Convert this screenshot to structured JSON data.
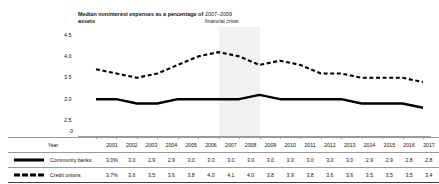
{
  "chart_data": {
    "type": "line",
    "title": "Median noninterest expenses as a percentage of assets",
    "xlabel": "Year",
    "ylabel": "",
    "ylim": [
      0,
      4.5
    ],
    "yticks": [
      "0",
      "2.5",
      "3.0",
      "3.5",
      "4.0",
      "4.5"
    ],
    "grid": false,
    "legend_position": "table-left",
    "categories": [
      "2001",
      "2002",
      "2003",
      "2004",
      "2005",
      "2006",
      "2007",
      "2008",
      "2009",
      "2010",
      "2011",
      "2012",
      "2013",
      "2014",
      "2015",
      "2016",
      "2017"
    ],
    "series": [
      {
        "name": "Community banks",
        "style": "solid",
        "color": "#000000",
        "values": [
          3.0,
          3.0,
          2.9,
          2.9,
          3.0,
          3.0,
          3.0,
          3.0,
          3.1,
          3.0,
          3.0,
          3.0,
          3.0,
          2.9,
          2.9,
          2.9,
          2.8
        ],
        "labels": [
          "3.0%",
          "3.0",
          "2.9",
          "2.9",
          "3.0",
          "3.0",
          "3.0",
          "3.0",
          "3.0",
          "3.0",
          "3.0",
          "3.0",
          "3.0",
          "2.9",
          "2.9",
          "2.8",
          "2.8"
        ]
      },
      {
        "name": "Credit unions",
        "style": "dashed",
        "color": "#000000",
        "values": [
          3.7,
          3.6,
          3.5,
          3.6,
          3.8,
          4.0,
          4.1,
          4.0,
          3.8,
          3.9,
          3.8,
          3.6,
          3.6,
          3.5,
          3.5,
          3.5,
          3.4
        ],
        "labels": [
          "3.7%",
          "3.6",
          "3.5",
          "3.6",
          "3.8",
          "4.0",
          "4.1",
          "4.0",
          "3.8",
          "3.9",
          "3.8",
          "3.6",
          "3.6",
          "3.5",
          "3.5",
          "3.5",
          "3.4"
        ]
      }
    ],
    "annotations": [
      {
        "text": "2007–2009\nfinancial crisis",
        "line1": "2007–2009",
        "line2": "financial crisis",
        "band_start": "2007",
        "band_end": "2009",
        "band_color": "#f1f1f1"
      }
    ]
  },
  "table": {
    "year_header": "Year"
  }
}
